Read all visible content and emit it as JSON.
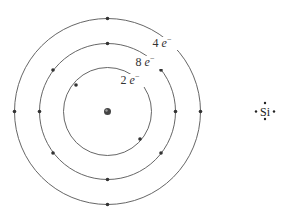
{
  "atom_model": {
    "element": "Si",
    "nucleus": {
      "cx": 107.5,
      "cy": 111.5
    },
    "shells": [
      {
        "name": "shell-1",
        "radius": 44,
        "label": "2",
        "electron_symbol": "e",
        "charge": "−",
        "electron_count": 2,
        "electrons": [
          [
            76,
            85
          ],
          [
            140,
            139
          ]
        ],
        "label_pos": [
          130,
          84
        ]
      },
      {
        "name": "shell-2",
        "radius": 68,
        "label": "8",
        "electron_symbol": "e",
        "charge": "−",
        "electron_count": 8,
        "electrons": [
          [
            107.5,
            43.5
          ],
          [
            107.5,
            179.5
          ],
          [
            39.5,
            111.5
          ],
          [
            175.5,
            111.5
          ],
          [
            53,
            70
          ],
          [
            161,
            70
          ],
          [
            53,
            153
          ],
          [
            161,
            153
          ]
        ],
        "label_pos": [
          145,
          66
        ]
      },
      {
        "name": "shell-3",
        "radius": 93,
        "label": "4",
        "electron_symbol": "e",
        "charge": "−",
        "electron_count": 4,
        "electrons": [
          [
            107.5,
            18.5
          ],
          [
            107.5,
            204.5
          ],
          [
            14.5,
            111.5
          ],
          [
            200.5,
            111.5
          ]
        ],
        "label_pos": [
          162,
          47
        ]
      }
    ],
    "colors": {
      "line": "#555555",
      "electron": "#333333",
      "nucleus": "#444444"
    }
  },
  "lewis_structure": {
    "symbol": "Si",
    "valence_dots": 4
  }
}
